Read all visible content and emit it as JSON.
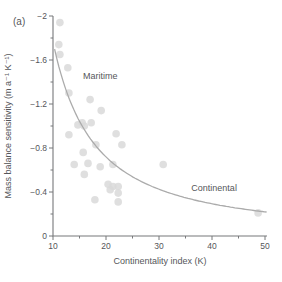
{
  "figure_label": "(a)",
  "chart_data": {
    "type": "scatter",
    "title": "",
    "xlabel": "Continentality index (K)",
    "ylabel": "Mass balance sensitivity (m a⁻¹ K⁻¹)",
    "x_axis": {
      "min": 10,
      "max": 50,
      "major_ticks": [
        10,
        20,
        30,
        40,
        50
      ],
      "tick_labels": [
        "10",
        "20",
        "30",
        "40",
        "50"
      ],
      "minor_ticks": [
        15,
        25,
        35,
        45
      ]
    },
    "y_axis": {
      "min": -2,
      "max": 0,
      "major_ticks": [
        -2,
        -1.6,
        -1.2,
        -0.8,
        -0.4,
        0
      ],
      "tick_labels": [
        "−2",
        "−1.6",
        "−1.2",
        "−0.8",
        "−0.4",
        "0"
      ],
      "minor_ticks": [
        -1.8,
        -1.4,
        -1.0,
        -0.6,
        -0.2
      ]
    },
    "points": [
      [
        11.3,
        -1.94
      ],
      [
        11.1,
        -1.74
      ],
      [
        11.3,
        -1.65
      ],
      [
        12.8,
        -1.53
      ],
      [
        13.0,
        -1.3
      ],
      [
        17.0,
        -1.24
      ],
      [
        19.1,
        -1.14
      ],
      [
        15.5,
        -1.03
      ],
      [
        17.2,
        -1.03
      ],
      [
        14.7,
        -1.01
      ],
      [
        15.9,
        -1.0
      ],
      [
        13.0,
        -0.92
      ],
      [
        21.9,
        -0.93
      ],
      [
        23.0,
        -0.83
      ],
      [
        18.1,
        -0.83
      ],
      [
        15.7,
        -0.76
      ],
      [
        14.0,
        -0.65
      ],
      [
        16.6,
        -0.66
      ],
      [
        18.9,
        -0.63
      ],
      [
        21.3,
        -0.65
      ],
      [
        15.9,
        -0.56
      ],
      [
        30.8,
        -0.65
      ],
      [
        20.4,
        -0.47
      ],
      [
        21.3,
        -0.45
      ],
      [
        22.3,
        -0.45
      ],
      [
        20.8,
        -0.42
      ],
      [
        22.3,
        -0.39
      ],
      [
        17.9,
        -0.33
      ],
      [
        22.3,
        -0.31
      ],
      [
        48.7,
        -0.21
      ]
    ],
    "trend_curve": {
      "formula": "y = −34.8 · x^(−1.295)",
      "A": 34.8,
      "b": 1.295,
      "x_start": 10.3,
      "x_end": 50.3
    },
    "annotations": [
      {
        "text": "Maritime",
        "x": 18.9,
        "y": -1.43
      },
      {
        "text": "Continental",
        "x": 40.4,
        "y": -0.41
      }
    ],
    "legend": "none",
    "grid": false,
    "colors": {
      "point": "#d9d9d9",
      "curve": "#ababab",
      "axis": "#77787b",
      "text": "#55565a",
      "background": "#ffffff"
    }
  }
}
